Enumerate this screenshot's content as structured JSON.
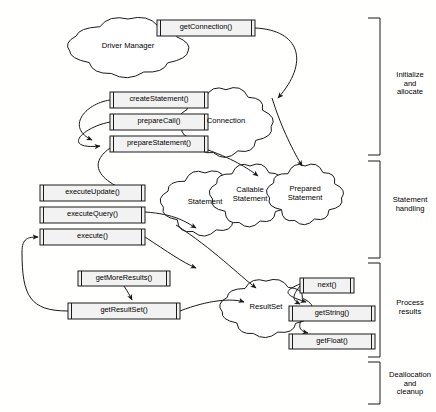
{
  "diagram": {
    "background": "#fffffe",
    "stroke": "#1a1a1a",
    "box_fill": "#f2f2f2",
    "cloud_fill": "#ffffff"
  },
  "clouds": [
    {
      "id": "driver-manager",
      "label": "Driver Manager",
      "cx": 128,
      "cy": 47,
      "rx": 56,
      "ry": 26
    },
    {
      "id": "connection",
      "label": "Connection",
      "cx": 226,
      "cy": 122,
      "rx": 42,
      "ry": 30
    },
    {
      "id": "statement",
      "label": "Statement",
      "cx": 205,
      "cy": 203,
      "rx": 40,
      "ry": 28
    },
    {
      "id": "callable-statement",
      "label": "Callable\nStatement",
      "cx": 250,
      "cy": 195,
      "rx": 36,
      "ry": 27
    },
    {
      "id": "prepared-statement",
      "label": "Prepared\nStatement",
      "cx": 305,
      "cy": 194,
      "rx": 34,
      "ry": 26
    },
    {
      "id": "result-set",
      "label": "ResultSet",
      "cx": 266,
      "cy": 308,
      "rx": 42,
      "ry": 25
    }
  ],
  "methods": [
    {
      "id": "get-connection",
      "label": "getConnection()",
      "x": 157,
      "y": 20,
      "w": 98,
      "h": 16
    },
    {
      "id": "create-statement",
      "label": "createStatement()",
      "x": 110,
      "y": 92,
      "w": 98,
      "h": 16
    },
    {
      "id": "prepare-call",
      "label": "prepareCall()",
      "x": 110,
      "y": 114,
      "w": 98,
      "h": 16
    },
    {
      "id": "prepare-statement",
      "label": "prepareStatement()",
      "x": 110,
      "y": 136,
      "w": 98,
      "h": 16
    },
    {
      "id": "execute-update",
      "label": "executeUpdate()",
      "x": 40,
      "y": 185,
      "w": 105,
      "h": 16
    },
    {
      "id": "execute-query",
      "label": "executeQuery()",
      "x": 40,
      "y": 207,
      "w": 105,
      "h": 16
    },
    {
      "id": "execute",
      "label": "execute()",
      "x": 40,
      "y": 229,
      "w": 105,
      "h": 16
    },
    {
      "id": "get-more-results",
      "label": "getMoreResults()",
      "x": 78,
      "y": 271,
      "w": 92,
      "h": 15
    },
    {
      "id": "get-result-set",
      "label": "getResultSet()",
      "x": 68,
      "y": 303,
      "w": 112,
      "h": 16
    },
    {
      "id": "next",
      "label": "next()",
      "x": 300,
      "y": 278,
      "w": 54,
      "h": 15
    },
    {
      "id": "get-string",
      "label": "getString()",
      "x": 289,
      "y": 306,
      "w": 86,
      "h": 15
    },
    {
      "id": "get-float",
      "label": "getFloat()",
      "x": 289,
      "y": 334,
      "w": 86,
      "h": 15
    }
  ],
  "phases": [
    {
      "id": "initialize-and-allocate",
      "label": "Initialize\nand\nallocate",
      "top": 18,
      "bottom": 155,
      "label_y": 71
    },
    {
      "id": "statement-handling",
      "label": "Statement\nhandling",
      "top": 161,
      "bottom": 258,
      "label_y": 196
    },
    {
      "id": "process-results",
      "label": "Process\nresults",
      "top": 263,
      "bottom": 357,
      "label_y": 299
    },
    {
      "id": "deallocation-and-cleanup",
      "label": "Deallocation\nand\ncleanup",
      "top": 362,
      "bottom": 404,
      "label_y": 371
    }
  ]
}
